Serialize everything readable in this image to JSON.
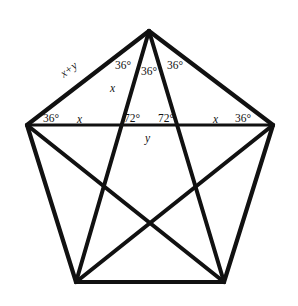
{
  "figure": {
    "kind": "geometry-diagram",
    "background_color": "#ffffff",
    "stroke_color": "#111111",
    "canvas": {
      "width": 298,
      "height": 306
    },
    "edge_stroke_width": 4.2,
    "diagonal_stroke_width": 4.0,
    "chord_stroke_width": 3.0,
    "vertices": [
      {
        "name": "apex-top",
        "x": 149,
        "y": 31
      },
      {
        "name": "vertex-right-upper",
        "x": 273,
        "y": 125
      },
      {
        "name": "vertex-right-lower",
        "x": 224,
        "y": 282
      },
      {
        "name": "vertex-left-lower",
        "x": 76,
        "y": 282
      },
      {
        "name": "vertex-left-upper",
        "x": 27,
        "y": 125
      }
    ],
    "edges": [
      {
        "name": "edge-top-left",
        "from": 0,
        "to": 4
      },
      {
        "name": "edge-top-right",
        "from": 0,
        "to": 1
      },
      {
        "name": "edge-right",
        "from": 1,
        "to": 2
      },
      {
        "name": "edge-bottom",
        "from": 2,
        "to": 3
      },
      {
        "name": "edge-left",
        "from": 3,
        "to": 4
      }
    ],
    "diagonals": [
      {
        "name": "diagonal-left-upper-to-right-upper",
        "from": 4,
        "to": 1
      },
      {
        "name": "diagonal-apex-to-left-lower",
        "from": 0,
        "to": 3
      },
      {
        "name": "diagonal-apex-to-right-lower",
        "from": 0,
        "to": 2
      },
      {
        "name": "diagonal-left-upper-to-right-lower",
        "from": 4,
        "to": 2
      },
      {
        "name": "diagonal-right-upper-to-left-lower",
        "from": 1,
        "to": 3
      }
    ],
    "labels": {
      "apex_left_angle": "36°",
      "apex_middle_angle": "36°",
      "apex_right_angle": "36°",
      "apex_side_var": "x",
      "upper_left_edge_var": "x+y",
      "left_base_angle": "36°",
      "left_chord_var": "x",
      "left_inner_angle": "72°",
      "right_inner_angle": "72°",
      "right_chord_var": "x",
      "right_base_angle": "36°",
      "below_chord_var": "y"
    }
  }
}
